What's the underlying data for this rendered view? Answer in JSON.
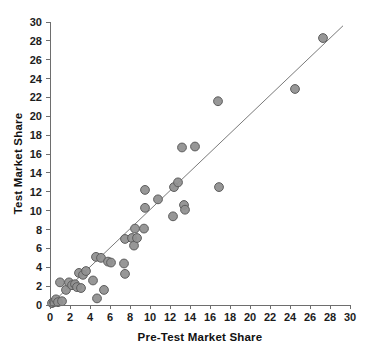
{
  "chart_data": {
    "type": "scatter",
    "title": "",
    "xlabel": "Pre-Test Market Share",
    "ylabel": "Test Market Share",
    "xlim": [
      0,
      30
    ],
    "ylim": [
      0,
      30
    ],
    "xticks": [
      0,
      2,
      4,
      6,
      8,
      10,
      12,
      14,
      16,
      18,
      20,
      22,
      24,
      26,
      28,
      30
    ],
    "yticks": [
      0,
      2,
      4,
      6,
      8,
      10,
      12,
      14,
      16,
      18,
      20,
      22,
      24,
      26,
      28,
      30
    ],
    "grid": false,
    "legend": null,
    "marker": {
      "shape": "circle",
      "fill_color": "#919191",
      "edge_color": "#5d5d5d",
      "radius_px": 4.4
    },
    "reference_line": {
      "label": "",
      "type": "identity-fit",
      "color": "#7a7a7a",
      "x_start": 0.3,
      "y_start": 0.3,
      "x_end": 29.3,
      "y_end": 29.6
    },
    "points": [
      {
        "x": 0.2,
        "y": 0.2
      },
      {
        "x": 0.4,
        "y": 0.3
      },
      {
        "x": 0.6,
        "y": 0.6
      },
      {
        "x": 0.8,
        "y": 0.3
      },
      {
        "x": 1.0,
        "y": 2.4
      },
      {
        "x": 1.2,
        "y": 0.4
      },
      {
        "x": 1.6,
        "y": 1.6
      },
      {
        "x": 1.9,
        "y": 2.4
      },
      {
        "x": 2.2,
        "y": 2.1
      },
      {
        "x": 2.5,
        "y": 2.2
      },
      {
        "x": 2.7,
        "y": 1.9
      },
      {
        "x": 2.9,
        "y": 3.4
      },
      {
        "x": 3.1,
        "y": 1.8
      },
      {
        "x": 3.3,
        "y": 3.2
      },
      {
        "x": 3.6,
        "y": 3.6
      },
      {
        "x": 4.3,
        "y": 2.6
      },
      {
        "x": 4.6,
        "y": 5.1
      },
      {
        "x": 4.7,
        "y": 0.7
      },
      {
        "x": 5.1,
        "y": 5.0
      },
      {
        "x": 5.4,
        "y": 1.6
      },
      {
        "x": 5.8,
        "y": 4.6
      },
      {
        "x": 6.1,
        "y": 4.5
      },
      {
        "x": 7.4,
        "y": 4.4
      },
      {
        "x": 7.5,
        "y": 3.3
      },
      {
        "x": 7.5,
        "y": 7.0
      },
      {
        "x": 8.2,
        "y": 7.1
      },
      {
        "x": 8.4,
        "y": 6.3
      },
      {
        "x": 8.5,
        "y": 8.1
      },
      {
        "x": 8.7,
        "y": 7.1
      },
      {
        "x": 9.4,
        "y": 8.1
      },
      {
        "x": 9.5,
        "y": 12.2
      },
      {
        "x": 9.5,
        "y": 10.3
      },
      {
        "x": 10.8,
        "y": 11.2
      },
      {
        "x": 12.3,
        "y": 9.4
      },
      {
        "x": 12.4,
        "y": 12.5
      },
      {
        "x": 12.8,
        "y": 13.0
      },
      {
        "x": 13.2,
        "y": 16.7
      },
      {
        "x": 13.4,
        "y": 10.6
      },
      {
        "x": 13.5,
        "y": 10.1
      },
      {
        "x": 14.5,
        "y": 16.8
      },
      {
        "x": 16.8,
        "y": 21.6
      },
      {
        "x": 16.9,
        "y": 12.5
      },
      {
        "x": 24.5,
        "y": 22.9
      },
      {
        "x": 27.3,
        "y": 28.3
      }
    ]
  }
}
